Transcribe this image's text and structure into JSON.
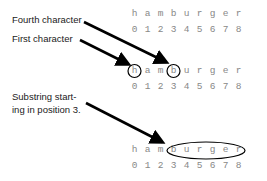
{
  "labels": {
    "fourth": "Fourth character",
    "first": "First character",
    "substring_line1": "Substring start-",
    "substring_line2": "ing in position 3."
  },
  "word": [
    "h",
    "a",
    "m",
    "b",
    "u",
    "r",
    "g",
    "e",
    "r"
  ],
  "indices": [
    "0",
    "1",
    "2",
    "3",
    "4",
    "5",
    "6",
    "7",
    "8"
  ],
  "rows": [
    {
      "name": "top",
      "highlight": "none"
    },
    {
      "name": "middle",
      "highlight": "circles at positions 0 and 3"
    },
    {
      "name": "bottom",
      "highlight": "ellipse around positions 3-8 (burger)"
    }
  ]
}
